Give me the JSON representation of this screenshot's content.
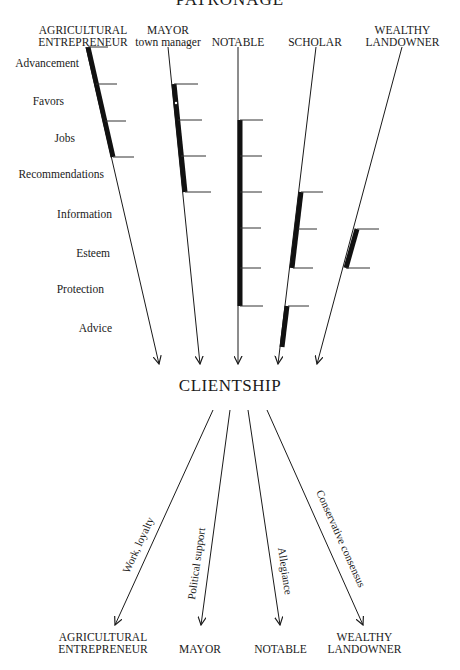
{
  "title": "PATRONAGE",
  "center_label": "CLIENTSHIP",
  "patrons": [
    {
      "line1": "AGRICULTURAL",
      "line2": "ENTREPRENEUR"
    },
    {
      "line1": "MAYOR",
      "line2": "town manager"
    },
    {
      "line1": "",
      "line2": "NOTABLE"
    },
    {
      "line1": "",
      "line2": "SCHOLAR"
    },
    {
      "line1": "WEALTHY",
      "line2": "LANDOWNER"
    }
  ],
  "resources": [
    "Advancement",
    "Favors",
    "Jobs",
    "Recommendations",
    "Information",
    "Esteem",
    "Protection",
    "Advice"
  ],
  "provisions": [
    {
      "patron": "AGRICULTURAL ENTREPRENEUR",
      "resources": [
        "Advancement",
        "Favors",
        "Jobs"
      ]
    },
    {
      "patron": "MAYOR",
      "resources": [
        "Favors",
        "Jobs",
        "Recommendations"
      ]
    },
    {
      "patron": "NOTABLE",
      "resources": [
        "Jobs",
        "Recommendations",
        "Information",
        "Esteem",
        "Protection"
      ]
    },
    {
      "patron": "SCHOLAR",
      "resources": [
        "Information",
        "Esteem",
        "Advice"
      ]
    },
    {
      "patron": "WEALTHY LANDOWNER",
      "resources": [
        "Esteem"
      ]
    }
  ],
  "returns": [
    {
      "label": "Work, loyalty",
      "to_line1": "AGRICULTURAL",
      "to_line2": "ENTREPRENEUR"
    },
    {
      "label": "Political support",
      "to_line1": "",
      "to_line2": "MAYOR"
    },
    {
      "label": "Allegiance",
      "to_line1": "",
      "to_line2": "NOTABLE"
    },
    {
      "label": "Conservative consensus",
      "to_line1": "WEALTHY",
      "to_line2": "LANDOWNER"
    }
  ]
}
